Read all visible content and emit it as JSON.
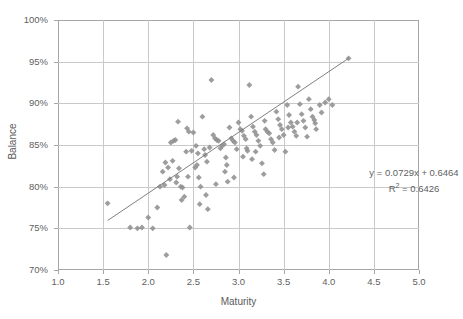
{
  "chart_data": {
    "type": "scatter",
    "title": "",
    "xlabel": "Maturity",
    "ylabel": "Balance",
    "xlim": [
      1.0,
      5.0
    ],
    "ylim": [
      0.7,
      1.0
    ],
    "xticks": [
      "1.0",
      "1.5",
      "2.0",
      "2.5",
      "3.0",
      "3.5",
      "4.0",
      "4.5",
      "5.0"
    ],
    "xtick_values": [
      1.0,
      1.5,
      2.0,
      2.5,
      3.0,
      3.5,
      4.0,
      4.5,
      5.0
    ],
    "yticks": [
      "70%",
      "75%",
      "80%",
      "85%",
      "90%",
      "95%",
      "100%"
    ],
    "ytick_values": [
      0.7,
      0.75,
      0.8,
      0.85,
      0.9,
      0.95,
      1.0
    ],
    "grid": true,
    "legend": "none",
    "marker_color": "#8f8f8f",
    "marker_size": 4.6,
    "marker_shape": "diamond",
    "trendline_color": "#7f7f7f",
    "gridline_color": "#c9c9c9",
    "axis_color": "#a6a6a6",
    "annotations": {
      "equation": "y = 0.0729x + 0.6464",
      "r_squared_prefix": "R",
      "r_squared_sup": "2",
      "r_squared_value": " = 0.6426"
    },
    "trendline": {
      "slope": 0.0729,
      "intercept": 0.6464,
      "x_start": 1.55,
      "x_end": 4.22
    },
    "points": [
      [
        1.55,
        0.78
      ],
      [
        1.8,
        0.751
      ],
      [
        1.88,
        0.75
      ],
      [
        1.93,
        0.751
      ],
      [
        2.0,
        0.763
      ],
      [
        2.05,
        0.75
      ],
      [
        2.1,
        0.775
      ],
      [
        2.13,
        0.8
      ],
      [
        2.16,
        0.818
      ],
      [
        2.18,
        0.802
      ],
      [
        2.2,
        0.718
      ],
      [
        2.22,
        0.823
      ],
      [
        2.25,
        0.853
      ],
      [
        2.28,
        0.855
      ],
      [
        2.3,
        0.856
      ],
      [
        2.32,
        0.812
      ],
      [
        2.34,
        0.822
      ],
      [
        2.36,
        0.8
      ],
      [
        2.38,
        0.799
      ],
      [
        2.4,
        0.788
      ],
      [
        2.42,
        0.842
      ],
      [
        2.44,
        0.812
      ],
      [
        2.46,
        0.751
      ],
      [
        2.48,
        0.843
      ],
      [
        2.5,
        0.865
      ],
      [
        2.52,
        0.823
      ],
      [
        2.54,
        0.826
      ],
      [
        2.56,
        0.811
      ],
      [
        2.58,
        0.8
      ],
      [
        2.6,
        0.884
      ],
      [
        2.62,
        0.845
      ],
      [
        2.64,
        0.79
      ],
      [
        2.66,
        0.773
      ],
      [
        2.68,
        0.847
      ],
      [
        2.7,
        0.928
      ],
      [
        2.72,
        0.862
      ],
      [
        2.74,
        0.858
      ],
      [
        2.76,
        0.856
      ],
      [
        2.78,
        0.855
      ],
      [
        2.8,
        0.846
      ],
      [
        2.82,
        0.849
      ],
      [
        2.84,
        0.851
      ],
      [
        2.86,
        0.835
      ],
      [
        2.88,
        0.806
      ],
      [
        2.9,
        0.871
      ],
      [
        2.92,
        0.858
      ],
      [
        2.94,
        0.855
      ],
      [
        2.96,
        0.853
      ],
      [
        2.98,
        0.845
      ],
      [
        3.0,
        0.877
      ],
      [
        3.02,
        0.869
      ],
      [
        3.04,
        0.867
      ],
      [
        3.06,
        0.861
      ],
      [
        3.08,
        0.857
      ],
      [
        3.1,
        0.843
      ],
      [
        3.12,
        0.922
      ],
      [
        3.14,
        0.884
      ],
      [
        3.16,
        0.872
      ],
      [
        3.18,
        0.866
      ],
      [
        3.2,
        0.862
      ],
      [
        3.22,
        0.855
      ],
      [
        3.24,
        0.849
      ],
      [
        3.26,
        0.828
      ],
      [
        3.28,
        0.815
      ],
      [
        3.3,
        0.869
      ],
      [
        3.32,
        0.866
      ],
      [
        3.34,
        0.864
      ],
      [
        3.36,
        0.857
      ],
      [
        3.38,
        0.853
      ],
      [
        3.4,
        0.844
      ],
      [
        3.42,
        0.89
      ],
      [
        3.44,
        0.881
      ],
      [
        3.46,
        0.874
      ],
      [
        3.48,
        0.869
      ],
      [
        3.5,
        0.862
      ],
      [
        3.52,
        0.842
      ],
      [
        3.54,
        0.898
      ],
      [
        3.56,
        0.886
      ],
      [
        3.58,
        0.877
      ],
      [
        3.6,
        0.872
      ],
      [
        3.62,
        0.866
      ],
      [
        3.64,
        0.861
      ],
      [
        3.66,
        0.92
      ],
      [
        3.68,
        0.899
      ],
      [
        3.7,
        0.887
      ],
      [
        3.72,
        0.879
      ],
      [
        3.74,
        0.871
      ],
      [
        3.76,
        0.86
      ],
      [
        3.78,
        0.905
      ],
      [
        3.8,
        0.893
      ],
      [
        3.82,
        0.884
      ],
      [
        3.84,
        0.88
      ],
      [
        3.86,
        0.869
      ],
      [
        3.9,
        0.898
      ],
      [
        3.92,
        0.889
      ],
      [
        3.96,
        0.901
      ],
      [
        4.0,
        0.905
      ],
      [
        4.04,
        0.898
      ],
      [
        4.22,
        0.954
      ],
      [
        2.33,
        0.878
      ],
      [
        2.45,
        0.866
      ],
      [
        2.55,
        0.84
      ],
      [
        2.65,
        0.83
      ],
      [
        2.85,
        0.818
      ],
      [
        3.05,
        0.836
      ],
      [
        3.15,
        0.833
      ],
      [
        2.37,
        0.784
      ],
      [
        2.57,
        0.779
      ],
      [
        2.75,
        0.803
      ],
      [
        2.95,
        0.811
      ],
      [
        2.27,
        0.831
      ],
      [
        2.19,
        0.829
      ],
      [
        2.43,
        0.87
      ],
      [
        2.53,
        0.849
      ],
      [
        2.63,
        0.838
      ],
      [
        2.87,
        0.826
      ],
      [
        3.09,
        0.846
      ],
      [
        3.19,
        0.842
      ],
      [
        3.29,
        0.879
      ],
      [
        3.45,
        0.859
      ],
      [
        3.55,
        0.871
      ],
      [
        3.65,
        0.877
      ],
      [
        3.85,
        0.876
      ],
      [
        2.24,
        0.809
      ],
      [
        2.31,
        0.805
      ]
    ]
  }
}
